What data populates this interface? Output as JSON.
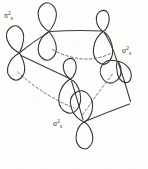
{
  "figure": {
    "kind": "hand-drawn orbital bonding diagram",
    "background_color": "#fdfdfb",
    "ink_color": "#2e2e2e",
    "dashed_color": "#6e6e6e"
  },
  "labels": [
    {
      "id": "label-pi-2s",
      "base": "π",
      "superscript": "2",
      "subscript": "s",
      "full_text": "π²s",
      "x": 4,
      "y": 18
    },
    {
      "id": "label-sigma-2s-right",
      "base": "σ",
      "superscript": "2",
      "subscript": "s",
      "full_text": "σ²s",
      "x": 122,
      "y": 53
    },
    {
      "id": "label-sigma-2s-bottom",
      "base": "σ",
      "superscript": "2",
      "subscript": "s",
      "full_text": "σ²s",
      "x": 53,
      "y": 126
    }
  ],
  "vertices": [
    {
      "id": "vertex-left",
      "x": 19,
      "y": 53
    },
    {
      "id": "vertex-top",
      "x": 49,
      "y": 31
    },
    {
      "id": "vertex-upper-right",
      "x": 103,
      "y": 31
    },
    {
      "id": "vertex-right",
      "x": 117,
      "y": 61
    },
    {
      "id": "vertex-center",
      "x": 70,
      "y": 79
    },
    {
      "id": "vertex-bottom",
      "x": 84,
      "y": 122
    },
    {
      "id": "vertex-lower-right",
      "x": 131,
      "y": 103
    }
  ],
  "bonds_solid": [
    {
      "id": "bond-top-upperright",
      "from": "vertex-top",
      "to": "vertex-upper-right"
    },
    {
      "id": "bond-left-top",
      "from": "vertex-left",
      "to": "vertex-top"
    },
    {
      "id": "bond-left-center",
      "from": "vertex-left",
      "to": "vertex-center"
    },
    {
      "id": "bond-right-lowerright",
      "from": "vertex-right",
      "to": "vertex-lower-right"
    },
    {
      "id": "bond-bottom-lowerright",
      "from": "vertex-bottom",
      "to": "vertex-lower-right"
    },
    {
      "id": "bond-upperright-right",
      "from": "vertex-upper-right",
      "to": "vertex-right"
    }
  ],
  "bonds_dashed": [
    {
      "id": "hidden-bond-top-right",
      "from": "vertex-top",
      "to": "vertex-right"
    },
    {
      "id": "hidden-bond-left-bottom",
      "from": "vertex-left",
      "to": "vertex-bottom"
    },
    {
      "id": "hidden-bond-right-bottom",
      "from": "vertex-right",
      "to": "vertex-bottom"
    }
  ],
  "orbitals": [
    {
      "id": "orbital-left",
      "at": "vertex-left",
      "shape": "figure-eight",
      "orientation": "vertical"
    },
    {
      "id": "orbital-top",
      "at": "vertex-top",
      "shape": "figure-eight",
      "orientation": "vertical"
    },
    {
      "id": "orbital-upper-right",
      "at": "vertex-upper-right",
      "shape": "figure-eight",
      "orientation": "tilted"
    },
    {
      "id": "orbital-right",
      "at": "vertex-right",
      "shape": "figure-eight",
      "orientation": "tilted"
    },
    {
      "id": "orbital-center",
      "at": "vertex-center",
      "shape": "figure-eight",
      "orientation": "tilted"
    },
    {
      "id": "orbital-bottom",
      "at": "vertex-bottom",
      "shape": "figure-eight",
      "orientation": "vertical"
    }
  ]
}
